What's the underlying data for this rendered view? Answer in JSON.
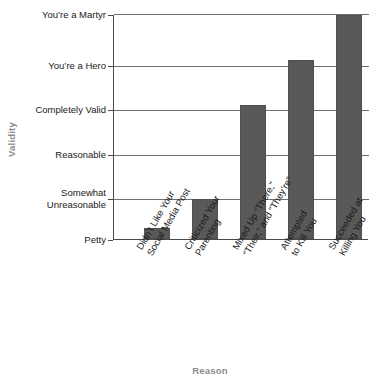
{
  "chart_data": {
    "type": "bar",
    "title": "",
    "xlabel": "Reason",
    "ylabel": "Validity",
    "categories": [
      "Didn’t Like Your\nSocial Media Post",
      "Criticized Your\nParenting",
      "Mixed Up “There,”\n“Their,” and “They’re”",
      "Attempted\nto Kill You",
      "Succeeded at\nKilling You"
    ],
    "values": [
      0.25,
      0.9,
      3,
      4,
      5
    ],
    "ytick_labels": [
      "Petty",
      "Somewhat\nUnreasonable",
      "Reasonable",
      "Completely Valid",
      "You’re a Hero",
      "You’re a Martyr"
    ],
    "ylim": [
      0,
      5
    ],
    "grid": true,
    "legend": false,
    "bar_color": "#595959",
    "axis_color": "#4a4a4a",
    "gridline_color": "#6f6f6f",
    "axis_title_color": "#8d8d8d"
  }
}
